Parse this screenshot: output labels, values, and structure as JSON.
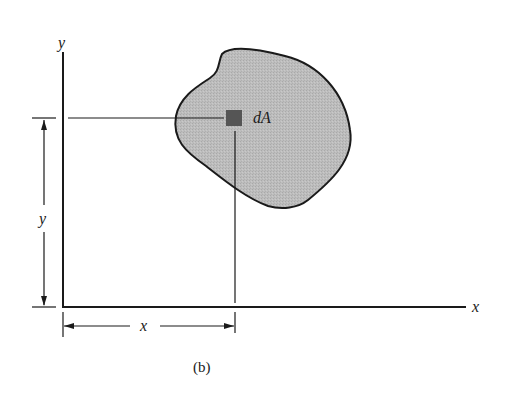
{
  "figure": {
    "caption": "(b)",
    "axis_labels": {
      "y_axis": "y",
      "x_axis": "x"
    },
    "dimension_labels": {
      "y_distance": "y",
      "x_distance": "x"
    },
    "element_label": "dA",
    "colors": {
      "region_fill": "#b9b9b9",
      "region_stroke": "#1a1a1a",
      "element_fill": "#555555",
      "line": "#1a1a1a"
    }
  }
}
